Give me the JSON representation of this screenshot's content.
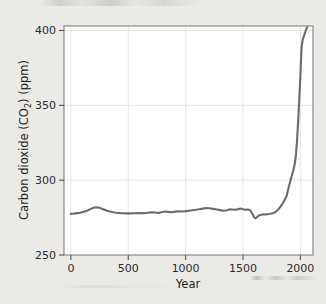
{
  "figure": {
    "background_color": "#ebeae7",
    "plot_background_color": "#ffffff",
    "line_color": "#6b6b6b",
    "grid_color": "#dedede",
    "border_color": "#808080",
    "text_color": "#222222"
  },
  "chart_data": {
    "type": "line",
    "title": "",
    "xlabel": "Year",
    "ylabel_parts": {
      "prefix": "Carbon dioxide (CO",
      "subscript": "2",
      "suffix": ") (ppm)"
    },
    "ylabel": "Carbon dioxide (CO2) (ppm)",
    "xlim": [
      -60,
      2110
    ],
    "ylim": [
      250,
      403
    ],
    "xticks": [
      0,
      500,
      1000,
      1500,
      2000
    ],
    "xtick_labels": [
      "0",
      "500",
      "1000",
      "1500",
      "2000"
    ],
    "yticks": [
      250,
      300,
      350,
      400
    ],
    "ytick_labels": [
      "250",
      "300",
      "350",
      "400"
    ],
    "grid": true,
    "grid_axes": "both",
    "legend": false,
    "series": [
      {
        "name": "Atmospheric CO2 concentration",
        "x": [
          0,
          20,
          40,
          60,
          80,
          100,
          120,
          140,
          160,
          180,
          200,
          220,
          240,
          260,
          280,
          300,
          320,
          340,
          360,
          380,
          400,
          430,
          460,
          490,
          520,
          550,
          580,
          610,
          640,
          670,
          700,
          730,
          760,
          790,
          820,
          850,
          880,
          910,
          940,
          970,
          1000,
          1030,
          1060,
          1090,
          1120,
          1150,
          1180,
          1210,
          1240,
          1270,
          1300,
          1330,
          1360,
          1390,
          1420,
          1450,
          1480,
          1500,
          1520,
          1540,
          1560,
          1575,
          1590,
          1600,
          1610,
          1625,
          1640,
          1660,
          1680,
          1700,
          1720,
          1740,
          1760,
          1780,
          1800,
          1820,
          1840,
          1860,
          1880,
          1900,
          1920,
          1940,
          1950,
          1960,
          1970,
          1980,
          1990,
          2000,
          2010,
          2020,
          2035,
          2050,
          2060
        ],
        "y": [
          277.5,
          277.6,
          277.8,
          278.0,
          278.2,
          278.6,
          279.0,
          279.6,
          280.3,
          281.0,
          281.6,
          281.9,
          281.7,
          281.2,
          280.6,
          280.0,
          279.4,
          279.0,
          278.7,
          278.4,
          278.2,
          278.0,
          277.9,
          277.8,
          277.8,
          277.9,
          278.1,
          278.0,
          277.9,
          278.2,
          278.6,
          278.4,
          278.1,
          278.5,
          279.0,
          278.8,
          278.6,
          279.0,
          279.2,
          279.1,
          279.3,
          279.6,
          279.9,
          280.2,
          280.6,
          281.0,
          281.4,
          281.2,
          280.8,
          280.4,
          280.0,
          279.6,
          279.9,
          280.6,
          280.2,
          280.5,
          281.0,
          280.6,
          280.2,
          280.4,
          280.0,
          278.4,
          276.4,
          274.8,
          274.5,
          275.6,
          276.4,
          276.9,
          277.2,
          277.1,
          277.4,
          277.6,
          277.9,
          278.6,
          279.8,
          281.6,
          283.8,
          286.4,
          289.4,
          295.8,
          301.6,
          307.0,
          310.5,
          315.8,
          325.6,
          338.6,
          353.8,
          369.4,
          388.6,
          393.8,
          397.2,
          400.6,
          402.4
        ]
      }
    ]
  }
}
